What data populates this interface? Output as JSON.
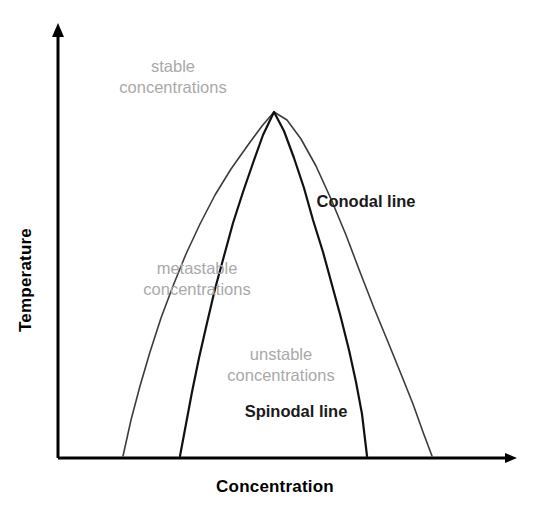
{
  "figure": {
    "type": "phase-diagram",
    "background_color": "#ffffff"
  },
  "axes": {
    "x_title": "Concentration",
    "y_title": "Temperature",
    "axis_color": "#000000",
    "x_axis": {
      "origin_x": 58,
      "origin_y": 458,
      "tip_x": 518,
      "tip_y": 458
    },
    "y_axis": {
      "origin_x": 58,
      "origin_y": 458,
      "tip_x": 58,
      "tip_y": 22
    },
    "ticks": [],
    "tick_labels": []
  },
  "region_labels": [
    {
      "id": "stable",
      "text": "stable\nconcentrations",
      "color": "#a9a9a9",
      "x": 173,
      "y": 78
    },
    {
      "id": "metastable",
      "text": "metastable\nconcentrations",
      "color": "#a9a9a9",
      "x": 197,
      "y": 280
    },
    {
      "id": "unstable",
      "text": "unstable\nconcentrations",
      "color": "#a9a9a9",
      "x": 281,
      "y": 366
    }
  ],
  "curve_labels": [
    {
      "id": "conodal",
      "text": "Conodal line",
      "color": "#1a1a1a",
      "x": 366,
      "y": 202
    },
    {
      "id": "spinodal",
      "text": "Spinodal line",
      "color": "#1a1a1a",
      "x": 296,
      "y": 412
    }
  ],
  "chart_data": {
    "type": "line",
    "title": "",
    "xlabel": "Concentration",
    "ylabel": "Temperature",
    "xlim": [
      58,
      518
    ],
    "ylim": [
      458,
      22
    ],
    "grid": false,
    "legend": "inline-annotations",
    "series": [
      {
        "name": "Conodal line",
        "color": "#3c3c3c",
        "width": 1.6,
        "description": "Outer binodal/coexistence dome, wider; apex shared with spinodal",
        "apex": {
          "x": 274,
          "y": 112
        },
        "left_foot": {
          "x": 123,
          "y": 456
        },
        "right_foot": {
          "x": 432,
          "y": 456
        },
        "points": [
          [
            123,
            456
          ],
          [
            131,
            420
          ],
          [
            140,
            386
          ],
          [
            150,
            352
          ],
          [
            161,
            318
          ],
          [
            173,
            286
          ],
          [
            186,
            254
          ],
          [
            200,
            224
          ],
          [
            215,
            195
          ],
          [
            231,
            169
          ],
          [
            248,
            145
          ],
          [
            262,
            126
          ],
          [
            274,
            112
          ],
          [
            287,
            120
          ],
          [
            301,
            139
          ],
          [
            316,
            166
          ],
          [
            331,
            199
          ],
          [
            346,
            235
          ],
          [
            360,
            272
          ],
          [
            374,
            308
          ],
          [
            388,
            342
          ],
          [
            401,
            374
          ],
          [
            413,
            404
          ],
          [
            423,
            432
          ],
          [
            432,
            456
          ]
        ]
      },
      {
        "name": "Spinodal line",
        "color": "#111111",
        "width": 2.2,
        "description": "Inner spinodal dome, narrower; apex shared with conodal",
        "apex": {
          "x": 274,
          "y": 112
        },
        "left_foot": {
          "x": 180,
          "y": 456
        },
        "right_foot": {
          "x": 367,
          "y": 456
        },
        "points": [
          [
            180,
            456
          ],
          [
            186,
            424
          ],
          [
            192,
            392
          ],
          [
            199,
            358
          ],
          [
            207,
            323
          ],
          [
            215,
            289
          ],
          [
            224,
            256
          ],
          [
            233,
            223
          ],
          [
            243,
            192
          ],
          [
            253,
            163
          ],
          [
            263,
            135
          ],
          [
            274,
            112
          ],
          [
            284,
            131
          ],
          [
            294,
            158
          ],
          [
            304,
            188
          ],
          [
            313,
            220
          ],
          [
            323,
            252
          ],
          [
            332,
            285
          ],
          [
            341,
            318
          ],
          [
            349,
            350
          ],
          [
            356,
            382
          ],
          [
            362,
            414
          ],
          [
            367,
            456
          ]
        ]
      }
    ]
  }
}
